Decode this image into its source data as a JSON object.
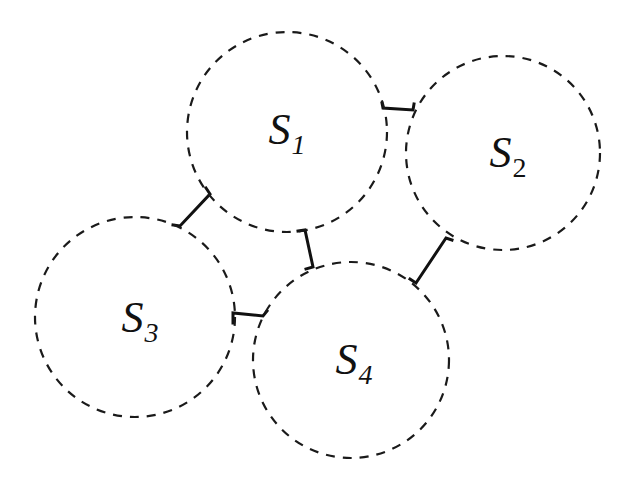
{
  "diagram": {
    "type": "connectivity-diagram",
    "stroke_color": "#1a1a1a",
    "background": "#ffffff",
    "nodes": [
      {
        "id": "S1",
        "base": "S",
        "sub": "1",
        "cx": 287,
        "cy": 132,
        "r": 100,
        "label_x": 287,
        "label_y": 130,
        "sub_italic": true
      },
      {
        "id": "S2",
        "base": "S",
        "sub": "2",
        "cx": 503,
        "cy": 153,
        "r": 97,
        "label_x": 508,
        "label_y": 153,
        "sub_italic": false
      },
      {
        "id": "S3",
        "base": "S",
        "sub": "3",
        "cx": 135,
        "cy": 317,
        "r": 100,
        "label_x": 140,
        "label_y": 318,
        "sub_italic": true
      },
      {
        "id": "S4",
        "base": "S",
        "sub": "4",
        "cx": 351,
        "cy": 360,
        "r": 98,
        "label_x": 354,
        "label_y": 360,
        "sub_italic": true
      }
    ],
    "edges": [
      {
        "from": "S1",
        "to": "S2",
        "path": "M382 103 L383 108 L413 110 L414 104"
      },
      {
        "from": "S1",
        "to": "S3",
        "path": "M206 188 L210 194 L180 226 L173 225"
      },
      {
        "from": "S1",
        "to": "S4",
        "path": "M298 231 L305 230 L313 267 L306 269"
      },
      {
        "from": "S3",
        "to": "S4",
        "path": "M233 323 L233 313 L263 316 L267 311"
      },
      {
        "from": "S2",
        "to": "S4",
        "path": "M452 240 L446 238 L416 283 L410 279"
      }
    ]
  }
}
